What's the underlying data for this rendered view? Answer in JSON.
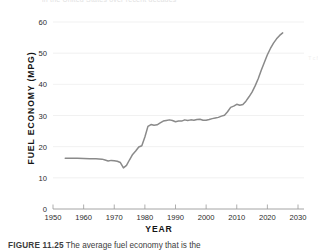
{
  "figure": {
    "caption_label": "FIGURE 11.25",
    "caption_text": "The average fuel economy that is the",
    "top_bleed_text": "in the United States over recent decades",
    "right_bleed_text": "T\nc\nf"
  },
  "chart_data": {
    "type": "line",
    "title": "",
    "xlabel": "YEAR",
    "ylabel": "FUEL ECONOMY (MPG)",
    "xlim": [
      1950,
      2030
    ],
    "ylim": [
      0,
      60
    ],
    "xticks": [
      1950,
      1960,
      1970,
      1980,
      1990,
      2000,
      2010,
      2020,
      2030
    ],
    "xtick_labels": [
      "1950",
      "1960",
      "1970",
      "1980",
      "1990",
      "2000",
      "2010",
      "2020",
      "2030"
    ],
    "yticks": [
      0,
      10,
      20,
      30,
      40,
      50,
      60
    ],
    "ytick_labels": [
      "0",
      "10",
      "20",
      "30",
      "40",
      "50",
      "60"
    ],
    "grid": "horizontal",
    "legend": "none",
    "line_color": "#8a8a8a",
    "line_width": 1.5,
    "axis_color": "#9a9a9a",
    "grid_color": "#ededed",
    "series": [
      {
        "name": "Average fuel economy",
        "x": [
          1954,
          1956,
          1958,
          1960,
          1962,
          1964,
          1966,
          1967,
          1968,
          1969,
          1970,
          1971,
          1972,
          1973,
          1974,
          1975,
          1976,
          1977,
          1978,
          1979,
          1980,
          1981,
          1982,
          1983,
          1984,
          1985,
          1986,
          1987,
          1988,
          1989,
          1990,
          1991,
          1992,
          1993,
          1994,
          1995,
          1996,
          1997,
          1998,
          1999,
          2000,
          2001,
          2002,
          2003,
          2004,
          2005,
          2006,
          2007,
          2008,
          2009,
          2010,
          2011,
          2012,
          2013,
          2014,
          2015,
          2016,
          2017,
          2018,
          2019,
          2020,
          2021,
          2022,
          2023,
          2024,
          2025
        ],
        "y": [
          16.3,
          16.3,
          16.3,
          16.2,
          16.1,
          16.1,
          16.0,
          15.7,
          15.4,
          15.6,
          15.5,
          15.3,
          14.9,
          13.2,
          14.0,
          15.8,
          17.5,
          18.6,
          19.9,
          20.3,
          23.1,
          26.5,
          27.1,
          26.9,
          27.0,
          27.6,
          28.2,
          28.4,
          28.6,
          28.4,
          28.0,
          28.2,
          28.2,
          28.6,
          28.4,
          28.6,
          28.5,
          28.7,
          28.8,
          28.5,
          28.5,
          28.7,
          29.0,
          29.2,
          29.4,
          29.8,
          30.1,
          31.2,
          32.6,
          33.0,
          33.6,
          33.3,
          33.5,
          34.6,
          36.0,
          37.5,
          39.5,
          41.8,
          44.5,
          47.0,
          49.5,
          51.5,
          53.2,
          54.6,
          55.7,
          56.5
        ]
      }
    ]
  }
}
